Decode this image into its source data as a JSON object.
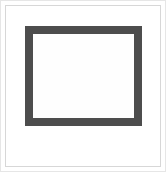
{
  "figure": {
    "canvas": {
      "width": 166,
      "height": 172,
      "background_color": "#ffffff"
    },
    "outer_border": {
      "name": "outer-edge",
      "color": "#e6e6e6",
      "thickness": 1
    },
    "inset_hairline": {
      "name": "inset-hairline",
      "color": "#d7d7d7",
      "thickness": 1,
      "inset": 5
    },
    "dark_frame": {
      "name": "dark-frame",
      "stroke_color": "#4d4d4d",
      "stroke_width": 8,
      "fill_color": "#fefefe",
      "x": 25,
      "y": 26,
      "width": 117,
      "height": 100
    },
    "interior": {
      "name": "frame-interior",
      "fill_color": "#fefefe"
    },
    "labels": {
      "none": ""
    }
  }
}
